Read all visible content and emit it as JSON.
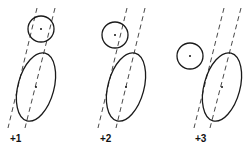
{
  "diagram": {
    "panels": [
      {
        "label": "+1",
        "label_pos": [
          10,
          142
        ],
        "circle": {
          "cx": 41,
          "cy": 29,
          "r": 13
        },
        "ellipse": {
          "cx": 36,
          "cy": 87,
          "rx": 18,
          "ry": 35,
          "rotate": 15
        },
        "dashed_lines": [
          {
            "x1": 37,
            "y1": 8,
            "x2": 8,
            "y2": 128
          },
          {
            "x1": 55,
            "y1": 8,
            "x2": 25,
            "y2": 128
          }
        ]
      },
      {
        "label": "+2",
        "label_pos": [
          100,
          142
        ],
        "circle": {
          "cx": 115,
          "cy": 35,
          "r": 13
        },
        "ellipse": {
          "cx": 126,
          "cy": 87,
          "rx": 18,
          "ry": 35,
          "rotate": 15
        },
        "dashed_lines": [
          {
            "x1": 127,
            "y1": 8,
            "x2": 98,
            "y2": 128
          },
          {
            "x1": 145,
            "y1": 8,
            "x2": 116,
            "y2": 128
          }
        ]
      },
      {
        "label": "+3",
        "label_pos": [
          195,
          142
        ],
        "circle": {
          "cx": 190,
          "cy": 56,
          "r": 13
        },
        "ellipse": {
          "cx": 222,
          "cy": 87,
          "rx": 18,
          "ry": 35,
          "rotate": 15
        },
        "dashed_lines": [
          {
            "x1": 224,
            "y1": 8,
            "x2": 194,
            "y2": 128
          },
          {
            "x1": 241,
            "y1": 8,
            "x2": 210,
            "y2": 128
          }
        ]
      }
    ]
  }
}
